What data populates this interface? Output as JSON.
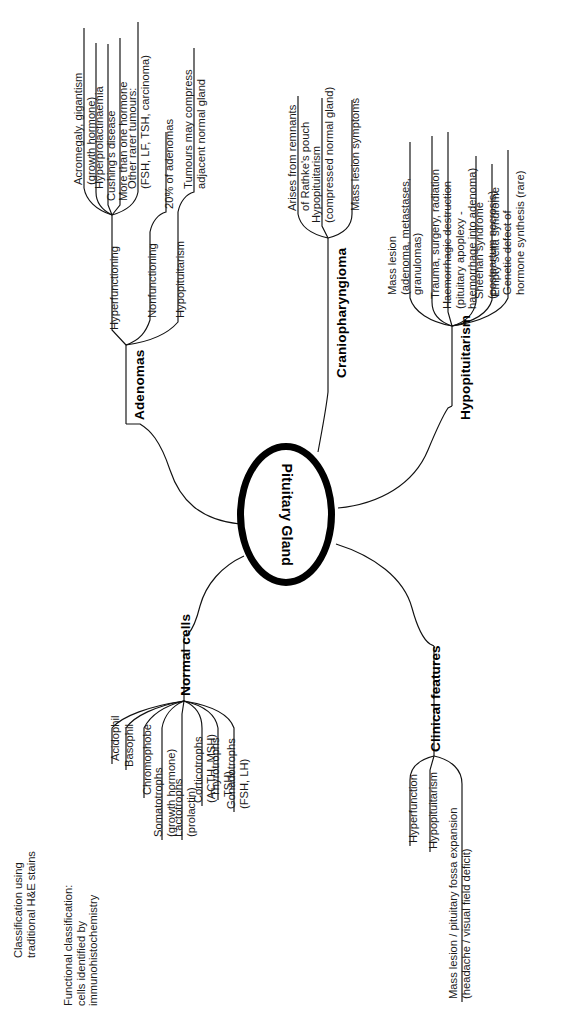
{
  "diagram": {
    "title": "Pituitary Gland",
    "type": "mind-map",
    "center": {
      "label": "Pituitary\nGland"
    },
    "branches": [
      {
        "id": "adenomas",
        "label": "Adenomas",
        "children": [
          {
            "id": "hyperfunctioning",
            "label": "Hyperfunctioning",
            "children": [
              {
                "id": "acromegaly",
                "label": "Acromegaly, gigantism\n(growth hormone)"
              },
              {
                "id": "hyperprolactinaemia",
                "label": "Hyperprolactinaemia"
              },
              {
                "id": "cushings",
                "label": "Cushing's disease"
              },
              {
                "id": "more-than-one-hormone",
                "label": "More than one hormone"
              },
              {
                "id": "other-rarer-tumours",
                "label": "Other rarer tumours:\n(FSH, LF, TSH, carcinoma)"
              }
            ]
          },
          {
            "id": "nonfunctioning",
            "label": "Nonfunctioning",
            "children": [
              {
                "id": "twenty-percent",
                "label": "20% of adenomas"
              }
            ]
          },
          {
            "id": "adenoma-hypopituitarism",
            "label": "Hypopituitarism",
            "children": [
              {
                "id": "tumours-compress",
                "label": "Tumours may compress\nadjacent normal gland"
              }
            ]
          }
        ]
      },
      {
        "id": "craniopharyngioma",
        "label": "Craniopharyngioma",
        "children": [
          {
            "id": "rathkes-pouch",
            "label": "Arises from remnants\nof Rathke's pouch"
          },
          {
            "id": "cranio-hypopituitarism",
            "label": "Hypopituitarism\n(compressed normal gland)"
          },
          {
            "id": "cranio-mass-lesion",
            "label": "Mass lesion symptoms"
          }
        ]
      },
      {
        "id": "hypopituitarism",
        "label": "Hypopituitarism",
        "children": [
          {
            "id": "mass-lesion",
            "label": "Mass lesion\n(adenoma, metastases,\ngranulomas)"
          },
          {
            "id": "trauma-surgery",
            "label": "Trauma, surgery, radiation"
          },
          {
            "id": "haemorrhagic-destruction",
            "label": "Haemorrhagic destruction\n(pituitary apoplexy -\nhaemorrhage into adenoma)"
          },
          {
            "id": "sheehan",
            "label": "Sheehan syndrome\n(postpartum necrosis)"
          },
          {
            "id": "empty-sella",
            "label": "Empty sella syndrome"
          },
          {
            "id": "genetic-defect",
            "label": "Genetic defect of\nhormone synthesis (rare)"
          }
        ]
      },
      {
        "id": "normal-cells",
        "label": "Normal cells",
        "children": [
          {
            "id": "acidophil",
            "label": "Acidophil"
          },
          {
            "id": "basophil",
            "label": "Basophil"
          },
          {
            "id": "chromophobe",
            "label": "Chromophobe"
          },
          {
            "id": "somatotrophs",
            "label": "Somatotrophs\n(growth hormone)"
          },
          {
            "id": "lactotrophs",
            "label": "Lactotrophs\n(prolactin)"
          },
          {
            "id": "corticotrophs",
            "label": "Corticotrophs\n(ACTH, MSH)"
          },
          {
            "id": "thyrotrophs",
            "label": "Thyrotrophs\nTSH)"
          },
          {
            "id": "gonadotrophs",
            "label": "Gonadotrophs\n(FSH, LH)"
          }
        ],
        "annotations": [
          {
            "id": "he-stains-note",
            "label": "Classification using\ntraditional H&E stains"
          },
          {
            "id": "immuno-note",
            "label": "Functional classification:\ncells identified by\nimmunohistochemistry"
          }
        ]
      },
      {
        "id": "clinical-features",
        "label": "Clinical features",
        "children": [
          {
            "id": "hyperfunction",
            "label": "Hyperfunction"
          },
          {
            "id": "clinical-hypopituitarism",
            "label": "Hypopituitarism"
          },
          {
            "id": "mass-lesion-fossa",
            "label": "Mass lesion / pituitary fossa expansion\n(headache / visual field deficit)"
          }
        ]
      }
    ]
  }
}
